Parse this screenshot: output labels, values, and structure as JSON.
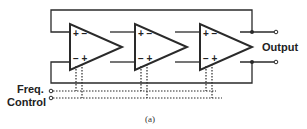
{
  "diagram": {
    "caption": "(a)",
    "labels": {
      "output": "Output",
      "freq": "Freq.",
      "control": "Control"
    },
    "amplifiers": [
      {
        "id": 1,
        "top_inputs": "+ −",
        "bottom_inputs": "− +"
      },
      {
        "id": 2,
        "top_inputs": "+ −",
        "bottom_inputs": "− +"
      },
      {
        "id": 3,
        "top_inputs": "+ −",
        "bottom_inputs": "− +"
      }
    ],
    "colors": {
      "line": "#2a2a2a",
      "background": "#ffffff"
    }
  }
}
